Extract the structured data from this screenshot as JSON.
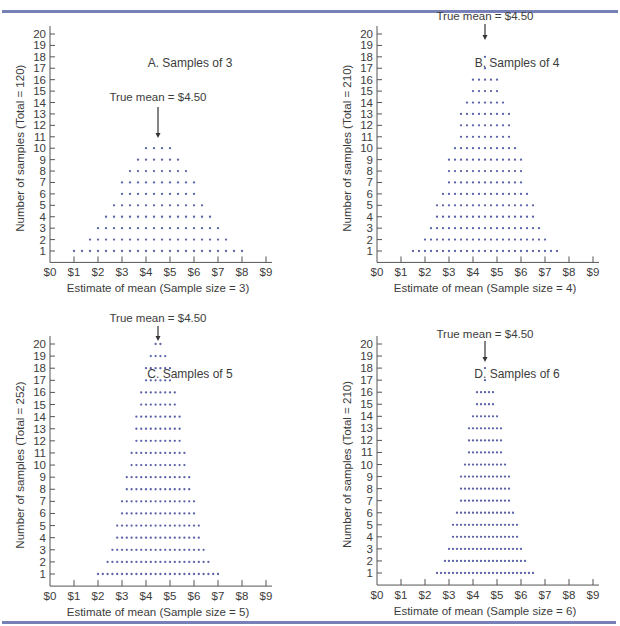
{
  "figure": {
    "rule_color": "#7880b8",
    "dot_color": "#5a62aa",
    "axis_color": "#555555",
    "true_mean_label": "True mean = $4.50",
    "true_mean_value": 4.5
  },
  "chart_data": [
    {
      "type": "scatter",
      "subtype": "dot-histogram",
      "title": "A. Samples of 3",
      "xlabel": "Estimate of mean (Sample size = 3)",
      "ylabel": "Number of samples (Total = 120)",
      "total": 120,
      "xlim": [
        0,
        9
      ],
      "ylim": [
        0,
        20
      ],
      "x_tick_labels": [
        "$0",
        "$1",
        "$2",
        "$3",
        "$4",
        "$5",
        "$6",
        "$7",
        "$8",
        "$9"
      ],
      "y_tick_labels": [
        "1",
        "2",
        "3",
        "4",
        "5",
        "6",
        "7",
        "8",
        "9",
        "10",
        "11",
        "12",
        "13",
        "14",
        "15",
        "16",
        "17",
        "18",
        "19",
        "20"
      ],
      "annotation": "True mean = $4.50",
      "x_start": 1.0,
      "x_step": 0.3333333,
      "counts": [
        1,
        1,
        2,
        3,
        4,
        5,
        7,
        8,
        9,
        10,
        10,
        10,
        10,
        9,
        8,
        7,
        5,
        4,
        3,
        2,
        1,
        1
      ]
    },
    {
      "type": "scatter",
      "subtype": "dot-histogram",
      "title": "B. Samples of 4",
      "xlabel": "Estimate of mean (Sample size = 4)",
      "ylabel": "Number of samples (Total = 210)",
      "total": 210,
      "xlim": [
        0,
        9
      ],
      "ylim": [
        0,
        20
      ],
      "x_tick_labels": [
        "$0",
        "$1",
        "$2",
        "$3",
        "$4",
        "$5",
        "$6",
        "$7",
        "$8",
        "$9"
      ],
      "y_tick_labels": [
        "1",
        "2",
        "3",
        "4",
        "5",
        "6",
        "7",
        "8",
        "9",
        "10",
        "11",
        "12",
        "13",
        "14",
        "15",
        "16",
        "17",
        "18",
        "19",
        "20"
      ],
      "annotation": "True mean = $4.50",
      "x_start": 1.5,
      "x_step": 0.25,
      "counts": [
        1,
        1,
        2,
        3,
        5,
        6,
        9,
        10,
        13,
        14,
        16,
        16,
        18,
        16,
        16,
        14,
        13,
        10,
        9,
        6,
        5,
        3,
        2,
        1,
        1
      ]
    },
    {
      "type": "scatter",
      "subtype": "dot-histogram",
      "title": "C. Samples of 5",
      "xlabel": "Estimate of mean (Sample size = 5)",
      "ylabel": "Number of samples (Total = 252)",
      "total": 252,
      "xlim": [
        0,
        9
      ],
      "ylim": [
        0,
        20
      ],
      "x_tick_labels": [
        "$0",
        "$1",
        "$2",
        "$3",
        "$4",
        "$5",
        "$6",
        "$7",
        "$8",
        "$9"
      ],
      "y_tick_labels": [
        "1",
        "2",
        "3",
        "4",
        "5",
        "6",
        "7",
        "8",
        "9",
        "10",
        "11",
        "12",
        "13",
        "14",
        "15",
        "16",
        "17",
        "18",
        "19",
        "20"
      ],
      "annotation": "True mean = $4.50",
      "x_start": 2.0,
      "x_step": 0.2,
      "counts": [
        1,
        1,
        2,
        3,
        5,
        7,
        9,
        11,
        14,
        16,
        18,
        19,
        20,
        20,
        19,
        18,
        16,
        14,
        11,
        9,
        7,
        5,
        3,
        2,
        1,
        1
      ]
    },
    {
      "type": "scatter",
      "subtype": "dot-histogram",
      "title": "D. Samples of 6",
      "xlabel": "Estimate of mean (Sample size = 6)",
      "ylabel": "Number of samples (Total = 210)",
      "total": 210,
      "xlim": [
        0,
        9
      ],
      "ylim": [
        0,
        20
      ],
      "x_tick_labels": [
        "$0",
        "$1",
        "$2",
        "$3",
        "$4",
        "$5",
        "$6",
        "$7",
        "$8",
        "$9"
      ],
      "y_tick_labels": [
        "1",
        "2",
        "3",
        "4",
        "5",
        "6",
        "7",
        "8",
        "9",
        "10",
        "11",
        "12",
        "13",
        "14",
        "15",
        "16",
        "17",
        "18",
        "19",
        "20"
      ],
      "annotation": "True mean = $4.50",
      "x_start": 2.5,
      "x_step": 0.1666667,
      "counts": [
        1,
        1,
        2,
        3,
        5,
        6,
        9,
        10,
        13,
        14,
        16,
        16,
        18,
        16,
        16,
        14,
        13,
        10,
        9,
        6,
        5,
        3,
        2,
        1,
        1
      ]
    }
  ]
}
